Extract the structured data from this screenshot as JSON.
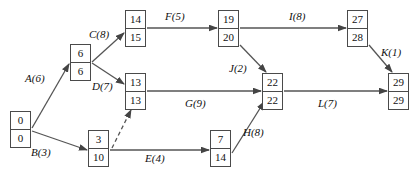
{
  "diagram": {
    "type": "activity-on-arrow-network",
    "colors": {
      "node_border": "#4a4a4a",
      "edge_line": "#555555",
      "text": "#111111",
      "background": "#ffffff"
    },
    "nodes": [
      {
        "id": "n-start",
        "early": "0",
        "late": "0",
        "x": 10,
        "y": 111
      },
      {
        "id": "n-6",
        "early": "6",
        "late": "6",
        "x": 70,
        "y": 44
      },
      {
        "id": "n-14",
        "early": "14",
        "late": "15",
        "x": 125,
        "y": 10
      },
      {
        "id": "n-13",
        "early": "13",
        "late": "13",
        "x": 125,
        "y": 73
      },
      {
        "id": "n-3",
        "early": "3",
        "late": "10",
        "x": 88,
        "y": 130
      },
      {
        "id": "n-19",
        "early": "19",
        "late": "20",
        "x": 218,
        "y": 10
      },
      {
        "id": "n-22",
        "early": "22",
        "late": "22",
        "x": 262,
        "y": 73
      },
      {
        "id": "n-7",
        "early": "7",
        "late": "14",
        "x": 210,
        "y": 130
      },
      {
        "id": "n-27",
        "early": "27",
        "late": "28",
        "x": 347,
        "y": 10
      },
      {
        "id": "n-29",
        "early": "29",
        "late": "29",
        "x": 388,
        "y": 73
      }
    ],
    "edges": [
      {
        "id": "edge-a",
        "label": "A(6)",
        "activity": "A",
        "duration": 6,
        "from": "n-start",
        "to": "n-6",
        "style": "solid",
        "label_x": 25,
        "label_y": 72
      },
      {
        "id": "edge-b",
        "label": "B(3)",
        "activity": "B",
        "duration": 3,
        "from": "n-start",
        "to": "n-3",
        "style": "solid",
        "label_x": 31,
        "label_y": 146
      },
      {
        "id": "edge-c",
        "label": "C(8)",
        "activity": "C",
        "duration": 8,
        "from": "n-6",
        "to": "n-14",
        "style": "solid",
        "label_x": 89,
        "label_y": 28
      },
      {
        "id": "edge-d",
        "label": "D(7)",
        "activity": "D",
        "duration": 7,
        "from": "n-6",
        "to": "n-13",
        "style": "solid",
        "label_x": 92,
        "label_y": 80
      },
      {
        "id": "edge-e",
        "label": "E(4)",
        "activity": "E",
        "duration": 4,
        "from": "n-3",
        "to": "n-7",
        "style": "solid",
        "label_x": 145,
        "label_y": 152
      },
      {
        "id": "edge-f",
        "label": "F(5)",
        "activity": "F",
        "duration": 5,
        "from": "n-14",
        "to": "n-19",
        "style": "solid",
        "label_x": 165,
        "label_y": 10
      },
      {
        "id": "edge-g",
        "label": "G(9)",
        "activity": "G",
        "duration": 9,
        "from": "n-13",
        "to": "n-22",
        "style": "solid",
        "label_x": 185,
        "label_y": 97
      },
      {
        "id": "edge-h",
        "label": "H(8)",
        "activity": "H",
        "duration": 8,
        "from": "n-7",
        "to": "n-22",
        "style": "solid",
        "label_x": 243,
        "label_y": 126
      },
      {
        "id": "edge-i",
        "label": "I(8)",
        "activity": "I",
        "duration": 8,
        "from": "n-19",
        "to": "n-27",
        "style": "solid",
        "label_x": 289,
        "label_y": 10
      },
      {
        "id": "edge-j",
        "label": "J(2)",
        "activity": "J",
        "duration": 2,
        "from": "n-19",
        "to": "n-22",
        "style": "solid",
        "label_x": 229,
        "label_y": 62
      },
      {
        "id": "edge-k",
        "label": "K(1)",
        "activity": "K",
        "duration": 1,
        "from": "n-27",
        "to": "n-29",
        "style": "solid",
        "label_x": 381,
        "label_y": 46
      },
      {
        "id": "edge-l",
        "label": "L(7)",
        "activity": "L",
        "duration": 7,
        "from": "n-22",
        "to": "n-29",
        "style": "solid",
        "label_x": 318,
        "label_y": 97
      },
      {
        "id": "edge-dummy",
        "label": "",
        "activity": "dummy",
        "duration": 0,
        "from": "n-3",
        "to": "n-13",
        "style": "dashed",
        "label_x": 0,
        "label_y": 0
      }
    ]
  }
}
